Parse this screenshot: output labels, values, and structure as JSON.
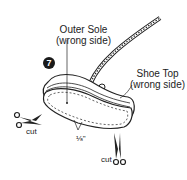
{
  "diagram": {
    "step_number": "7",
    "labels": {
      "outer_sole_title": "Outer Sole",
      "outer_sole_sub": "(wrong side)",
      "shoe_top_title": "Shoe Top",
      "shoe_top_sub": "(wrong side)",
      "seam_allowance": "⅛\"",
      "cut_left": "cut",
      "cut_bottom": "cut"
    },
    "colors": {
      "line": "#222222",
      "background": "#ffffff"
    }
  }
}
